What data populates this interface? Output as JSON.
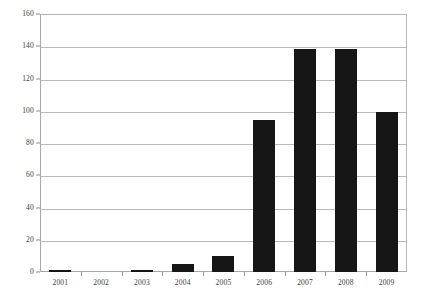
{
  "chart_data": {
    "type": "bar",
    "title": "",
    "subtitle": "",
    "xlabel": "",
    "ylabel": "",
    "categories": [
      "2001",
      "2002",
      "2003",
      "2004",
      "2005",
      "2006",
      "2007",
      "2008",
      "2009"
    ],
    "values": [
      1,
      0,
      1,
      5,
      10,
      94,
      138,
      138,
      99
    ],
    "series": [
      {
        "name": "",
        "values": [
          1,
          0,
          1,
          5,
          10,
          94,
          138,
          138,
          99
        ]
      }
    ],
    "ylim": [
      0,
      160
    ],
    "xlim": [
      0,
      9
    ],
    "ytick_labels": [
      "0",
      "20",
      "40",
      "60",
      "80",
      "100",
      "120",
      "140",
      "160"
    ],
    "ytick_values": [
      0,
      20,
      40,
      60,
      80,
      100,
      120,
      140,
      160
    ],
    "xtick_labels": [
      "2001",
      "2002",
      "2003",
      "2004",
      "2005",
      "2006",
      "2007",
      "2008",
      "2009"
    ],
    "grid": true,
    "grid_axis": "y",
    "legend": false,
    "legend_position": "none",
    "bar_color": "#161616",
    "grid_color": "#b9b9b9",
    "axis_color": "#a8a8a8",
    "background_color": "#ffffff",
    "annotations": []
  },
  "figure": {
    "frame_name": "plot-frame",
    "width_px": 422,
    "height_px": 301
  }
}
